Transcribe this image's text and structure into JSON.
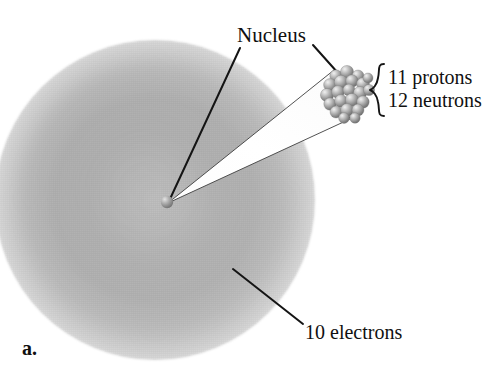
{
  "figure": {
    "letter": "a.",
    "element_description": "sodium atom ion with magnified nucleus callout"
  },
  "labels": {
    "nucleus": "Nucleus",
    "protons": "11 protons",
    "neutrons": "12 neutrons",
    "electrons": "10 electrons"
  },
  "counts": {
    "protons": 11,
    "neutrons": 12,
    "electrons": 10
  },
  "colors": {
    "background": "#ffffff",
    "text": "#101010",
    "leader_line": "#1c1c1c",
    "cloud_mid": "#b3b3b3",
    "cloud_edge": "#ffffff",
    "sphere_light": "#e8e8e8",
    "sphere_mid": "#a8a8a8",
    "sphere_dark": "#6e6e6e",
    "cone_fill": "#ffffff",
    "cone_stroke": "#3a3a3a"
  },
  "geometry": {
    "cloud_center": [
      155,
      200
    ],
    "cloud_radius": 160,
    "nucleus_dot": [
      167,
      202
    ],
    "nucleus_dot_radius": 6,
    "cluster_center": [
      348,
      93
    ],
    "cluster_radius": 25,
    "cone_apex": [
      168,
      203
    ],
    "cone_top": [
      334,
      72
    ],
    "cone_bottom": [
      349,
      118
    ]
  },
  "nucleus_particles": [
    {
      "cx": 336,
      "cy": 76,
      "r": 6.2
    },
    {
      "cx": 347,
      "cy": 72,
      "r": 6.6
    },
    {
      "cx": 358,
      "cy": 76,
      "r": 6.0
    },
    {
      "cx": 330,
      "cy": 85,
      "r": 6.4
    },
    {
      "cx": 341,
      "cy": 82,
      "r": 6.8
    },
    {
      "cx": 352,
      "cy": 81,
      "r": 6.2
    },
    {
      "cx": 363,
      "cy": 84,
      "r": 6.4
    },
    {
      "cx": 327,
      "cy": 95,
      "r": 6.6
    },
    {
      "cx": 338,
      "cy": 92,
      "r": 6.4
    },
    {
      "cx": 349,
      "cy": 90,
      "r": 6.0
    },
    {
      "cx": 360,
      "cy": 93,
      "r": 6.6
    },
    {
      "cx": 369,
      "cy": 90,
      "r": 5.6
    },
    {
      "cx": 330,
      "cy": 104,
      "r": 6.2
    },
    {
      "cx": 341,
      "cy": 101,
      "r": 6.4
    },
    {
      "cx": 352,
      "cy": 100,
      "r": 6.6
    },
    {
      "cx": 363,
      "cy": 102,
      "r": 6.2
    },
    {
      "cx": 336,
      "cy": 112,
      "r": 6.0
    },
    {
      "cx": 347,
      "cy": 110,
      "r": 6.4
    },
    {
      "cx": 358,
      "cy": 110,
      "r": 6.0
    },
    {
      "cx": 344,
      "cy": 118,
      "r": 5.4
    },
    {
      "cx": 355,
      "cy": 118,
      "r": 5.2
    },
    {
      "cx": 368,
      "cy": 78,
      "r": 5.0
    }
  ],
  "leader_lines": [
    {
      "name": "nucleus-to-dot",
      "x1": 240,
      "y1": 48,
      "x2": 170,
      "y2": 199
    },
    {
      "name": "nucleus-to-cluster",
      "x1": 313,
      "y1": 45,
      "x2": 338,
      "y2": 73
    },
    {
      "name": "electrons-to-cloud",
      "x1": 303,
      "y1": 324,
      "x2": 233,
      "y2": 269
    }
  ]
}
